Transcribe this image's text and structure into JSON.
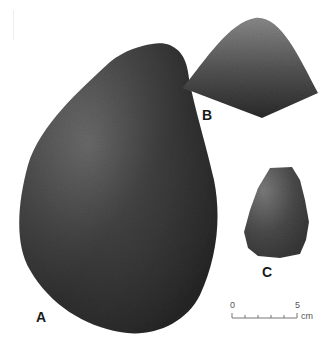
{
  "figure": {
    "specimens": [
      {
        "id": "A",
        "label": "A",
        "color_light": "#7a7a7a",
        "color_dark": "#2e2e2e"
      },
      {
        "id": "B",
        "label": "B",
        "color_light": "#8a8a8a",
        "color_dark": "#2a2a2a"
      },
      {
        "id": "C",
        "label": "C",
        "color_light": "#7c7c7c",
        "color_dark": "#333333"
      }
    ],
    "scale_bar": {
      "start_label": "0",
      "end_label": "5",
      "unit": "cm",
      "color": "#777777"
    },
    "background": "#ffffff"
  }
}
